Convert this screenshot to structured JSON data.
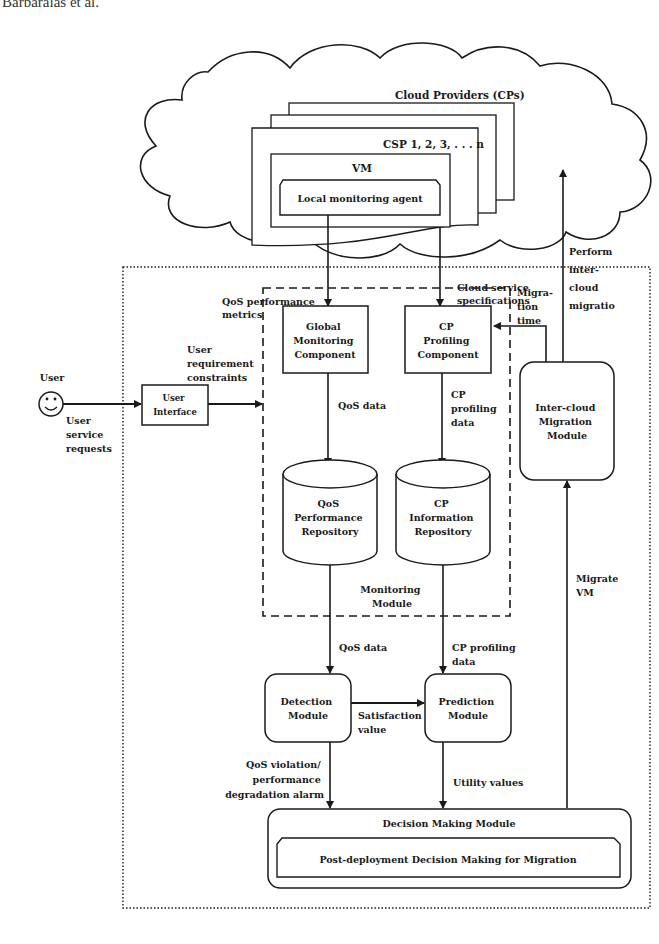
{
  "header": {
    "running_head": "Barbaralas et al."
  },
  "cloud": {
    "title": "Cloud Providers (CPs)",
    "csp_label": "CSP 1, 2, 3, . . . n",
    "vm_label": "VM",
    "agent_label": "Local monitoring agent"
  },
  "edges": {
    "qos_metrics": [
      "QoS performance",
      "metrics"
    ],
    "cloud_specs": [
      "Cloud service",
      "specifications"
    ],
    "perform_migration": [
      "Perform",
      "inter-",
      "cloud",
      "migratio"
    ],
    "migration_time": [
      "Migra-",
      "tion",
      "time"
    ],
    "user_requirements": [
      "User",
      "requirement",
      "constraints"
    ],
    "user_requests": [
      "User",
      "service",
      "requests"
    ],
    "qos_data_1": "QoS data",
    "cp_profiling_data_1": [
      "CP",
      "profiling",
      "data"
    ],
    "qos_data_2": "QoS data",
    "cp_profiling_data_2": [
      "CP profiling",
      "data"
    ],
    "satisfaction_value": [
      "Satisfaction",
      "value"
    ],
    "qos_violation": [
      "QoS violation/",
      "performance",
      "degradation alarm"
    ],
    "utility_values": "Utility values",
    "migrate_vm": [
      "Migrate",
      "VM"
    ]
  },
  "nodes": {
    "user": "User",
    "user_interface": [
      "User",
      "Interface"
    ],
    "global_monitoring": [
      "Global",
      "Monitoring",
      "Component"
    ],
    "cp_profiling": [
      "CP",
      "Profiling",
      "Component"
    ],
    "qos_repo": [
      "QoS",
      "Performance",
      "Repository"
    ],
    "cp_repo": [
      "CP",
      "Information",
      "Repository"
    ],
    "monitoring_module": [
      "Monitoring",
      "Module"
    ],
    "inter_cloud": [
      "Inter-cloud",
      "Migration",
      "Module"
    ],
    "detection": [
      "Detection",
      "Module"
    ],
    "prediction": [
      "Prediction",
      "Module"
    ],
    "decision": "Decision Making Module",
    "post_deployment": "Post-deployment Decision Making for Migration"
  }
}
